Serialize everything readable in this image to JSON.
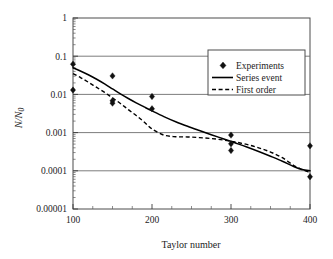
{
  "chart_data": {
    "type": "scatter",
    "title": "",
    "xlabel": "Taylor number",
    "ylabel": "N/N0",
    "ylabel_parts": {
      "numerator": "N",
      "slash": "/",
      "denominator": "N",
      "subscript": "0"
    },
    "xscale": "linear",
    "yscale": "log",
    "xlim": [
      100,
      400
    ],
    "ylim": [
      1e-05,
      1
    ],
    "grid": true,
    "grid_axis": "y",
    "legend_position": "top-right-inside",
    "xticks": [
      100,
      200,
      300,
      400
    ],
    "xtick_labels": [
      "100",
      "200",
      "300",
      "400"
    ],
    "xminor_step": 25,
    "yticks": [
      1,
      0.1,
      0.01,
      0.001,
      0.0001,
      1e-05
    ],
    "ytick_labels": [
      "1",
      "0.1",
      "0.01",
      "0.001",
      "0.0001",
      "0.00001"
    ],
    "series": [
      {
        "name": "Experiments",
        "kind": "scatter",
        "marker": "diamond",
        "color": "#111111",
        "points": [
          {
            "x": 100,
            "y": 0.062
          },
          {
            "x": 100,
            "y": 0.013
          },
          {
            "x": 150,
            "y": 0.0305
          },
          {
            "x": 150,
            "y": 0.0068
          },
          {
            "x": 150,
            "y": 0.0059
          },
          {
            "x": 200,
            "y": 0.0088
          },
          {
            "x": 200,
            "y": 0.0042
          },
          {
            "x": 300,
            "y": 0.00086
          },
          {
            "x": 300,
            "y": 0.00051
          },
          {
            "x": 300,
            "y": 0.00034
          },
          {
            "x": 400,
            "y": 0.00045
          },
          {
            "x": 400,
            "y": 7e-05
          }
        ]
      },
      {
        "name": "Series event",
        "kind": "line",
        "style": "solid",
        "color": "#000000",
        "x": [
          100,
          110,
          120,
          130,
          140,
          150,
          160,
          170,
          180,
          190,
          200,
          215,
          230,
          245,
          260,
          275,
          290,
          305,
          320,
          335,
          350,
          365,
          380,
          390,
          400
        ],
        "y": [
          0.05,
          0.0405,
          0.0322,
          0.0249,
          0.0188,
          0.0139,
          0.0103,
          0.0078,
          0.006,
          0.0047,
          0.0037,
          0.00262,
          0.00192,
          0.00146,
          0.00113,
          0.00088,
          0.00069,
          0.00054,
          0.00042,
          0.00032,
          0.00024,
          0.000178,
          0.000128,
          0.000108,
          0.0001
        ]
      },
      {
        "name": "First order",
        "kind": "line",
        "style": "dashed",
        "color": "#000000",
        "x": [
          100,
          110,
          120,
          130,
          140,
          150,
          160,
          170,
          180,
          190,
          200,
          215,
          230,
          245,
          260,
          275,
          290,
          305,
          320,
          335,
          350,
          365,
          380,
          390,
          400
        ],
        "y": [
          0.035,
          0.0272,
          0.0205,
          0.0152,
          0.0113,
          0.0081,
          0.0058,
          0.004,
          0.0028,
          0.0019,
          0.00125,
          0.00086,
          0.00078,
          0.00077,
          0.00074,
          0.0007,
          0.00064,
          0.00057,
          0.00049,
          0.0004,
          0.00031,
          0.00022,
          0.000135,
          0.000108,
          9e-05
        ]
      }
    ],
    "legend_entries": [
      {
        "label": "Experiments",
        "symbol": "diamond"
      },
      {
        "label": "Series event",
        "symbol": "solid-line"
      },
      {
        "label": "First order",
        "symbol": "dashed-line"
      }
    ]
  }
}
